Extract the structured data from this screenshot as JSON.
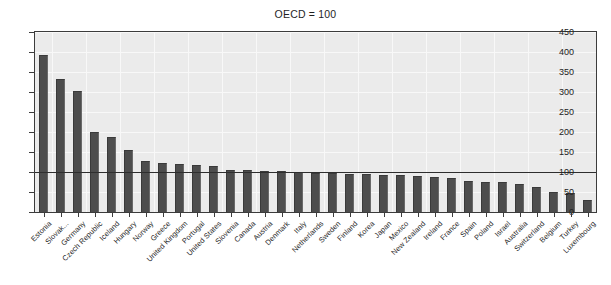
{
  "chart_data": {
    "type": "bar",
    "title": "OECD = 100",
    "xlabel": "",
    "ylabel": "",
    "ylim": [
      0,
      450
    ],
    "yticks": [
      0,
      50,
      100,
      150,
      200,
      250,
      300,
      350,
      400,
      450
    ],
    "grid": true,
    "legend": null,
    "reference_line": {
      "value": 100,
      "label": "OECD = 100"
    },
    "categories": [
      "Estonia",
      "Slovak...",
      "Germany",
      "Czech Republic",
      "Iceland",
      "Hungary",
      "Norway",
      "Greece",
      "United Kingdom",
      "Portugal",
      "United States",
      "Slovenia",
      "Canada",
      "Austria",
      "Denmark",
      "Italy",
      "Netherlands",
      "Sweden",
      "Finland",
      "Korea",
      "Japan",
      "Mexico",
      "New Zealand",
      "Ireland",
      "France",
      "Spain",
      "Poland",
      "Israel",
      "Australia",
      "Switzerland",
      "Belgium",
      "Turkey",
      "Luxembourg"
    ],
    "values": [
      392,
      333,
      302,
      199,
      188,
      154,
      128,
      122,
      120,
      118,
      115,
      105,
      105,
      103,
      102,
      99,
      98,
      98,
      96,
      94,
      93,
      93,
      90,
      87,
      85,
      78,
      75,
      74,
      70,
      63,
      51,
      47,
      30
    ]
  },
  "axis": {
    "y_tick_labels": [
      "0",
      "50",
      "100",
      "150",
      "200",
      "250",
      "300",
      "350",
      "400",
      "450"
    ]
  },
  "colors": {
    "bar": "#4d4d4d",
    "plot_background": "#ebebeb",
    "frame": "#3c3c3c",
    "reference_line": "#2e2e2e",
    "gridline": "#f8f8f8",
    "text": "#1f1f1f"
  }
}
